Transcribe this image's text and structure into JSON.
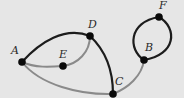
{
  "diagram": {
    "type": "graph",
    "background": "#e6e6e6",
    "colors": {
      "dark_edge": "#1c1c1c",
      "light_edge": "#8a8a8a",
      "node": "#0a0a0a",
      "label": "#2a2a2a"
    },
    "nodes": [
      {
        "id": "A",
        "label": "A",
        "x": 22,
        "y": 62
      },
      {
        "id": "E",
        "label": "E",
        "x": 63,
        "y": 66
      },
      {
        "id": "D",
        "label": "D",
        "x": 90,
        "y": 36
      },
      {
        "id": "C",
        "label": "C",
        "x": 113,
        "y": 94
      },
      {
        "id": "B",
        "label": "B",
        "x": 144,
        "y": 60
      },
      {
        "id": "F",
        "label": "F",
        "x": 159,
        "y": 17
      }
    ],
    "edges": [
      {
        "from": "A",
        "to": "D",
        "style": "dark"
      },
      {
        "from": "A",
        "to": "E",
        "style": "light"
      },
      {
        "from": "E",
        "to": "D",
        "style": "light"
      },
      {
        "from": "D",
        "to": "C",
        "style": "dark"
      },
      {
        "from": "A",
        "to": "C",
        "style": "light"
      },
      {
        "from": "C",
        "to": "B",
        "style": "light"
      },
      {
        "from": "B",
        "to": "F",
        "style": "dark",
        "note": "left arc"
      },
      {
        "from": "F",
        "to": "B",
        "style": "dark",
        "note": "right arc"
      }
    ]
  }
}
